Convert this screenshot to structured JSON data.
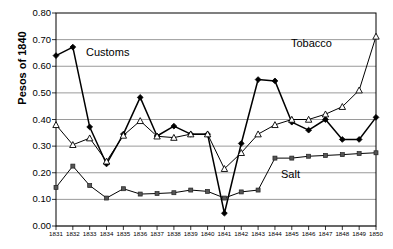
{
  "chart_data": {
    "type": "line",
    "title": "",
    "xlabel": "",
    "ylabel": "Pesos of 1840",
    "ylim": [
      0.0,
      0.8
    ],
    "ytick_labels": [
      "0.80",
      "0.70",
      "0.60",
      "0.50",
      "0.40",
      "0.30",
      "0.20",
      "0.10",
      "0.00"
    ],
    "ytick_values": [
      0.8,
      0.7,
      0.6,
      0.5,
      0.4,
      0.3,
      0.2,
      0.1,
      0.0
    ],
    "grid": true,
    "legend_position": "inline-annotations",
    "categories": [
      "1831",
      "1832",
      "1833",
      "1834",
      "1835",
      "1836",
      "1837",
      "1838",
      "1839",
      "1840",
      "1841",
      "1842",
      "1843",
      "1844",
      "1845",
      "1846",
      "1847",
      "1848",
      "1849",
      "1850"
    ],
    "series": [
      {
        "name": "Customs",
        "marker": "diamond",
        "values": [
          0.64,
          0.672,
          0.372,
          0.233,
          0.345,
          0.483,
          0.338,
          0.375,
          0.345,
          0.345,
          0.048,
          0.31,
          0.55,
          0.545,
          0.39,
          0.36,
          0.4,
          0.325,
          0.325,
          0.408
        ]
      },
      {
        "name": "Tobacco",
        "marker": "triangle",
        "values": [
          0.38,
          0.305,
          0.33,
          0.243,
          0.34,
          0.395,
          0.337,
          0.332,
          0.345,
          0.345,
          0.215,
          0.275,
          0.345,
          0.38,
          0.4,
          0.4,
          0.42,
          0.448,
          0.51,
          0.512
        ]
      },
      {
        "name": "Salt",
        "marker": "square",
        "values": [
          0.145,
          0.225,
          0.152,
          0.105,
          0.14,
          0.12,
          0.122,
          0.125,
          0.135,
          0.13,
          0.105,
          0.128,
          0.135,
          0.255,
          0.255,
          0.262,
          0.265,
          0.268,
          0.272,
          0.275
        ]
      }
    ],
    "annotations": [
      {
        "text": "Customs",
        "series": "Customs"
      },
      {
        "text": "Tobacco",
        "series": "Tobacco"
      },
      {
        "text": "Salt",
        "series": "Salt"
      }
    ],
    "extra_points": [
      {
        "series": "Tobacco",
        "category": "1850",
        "value": 0.712,
        "note": "terminal rise"
      }
    ],
    "colors": {
      "line": "#000000",
      "grid": "#808080",
      "axis": "#000000",
      "background": "#ffffff"
    }
  }
}
